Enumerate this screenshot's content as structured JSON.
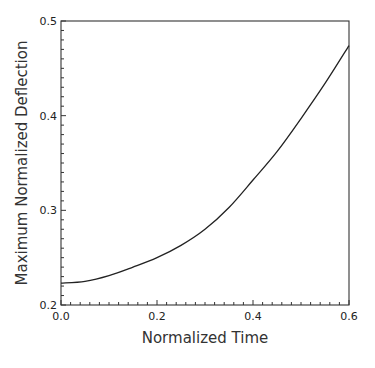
{
  "chart_data": {
    "type": "line",
    "title": "",
    "xlabel": "Normalized Time",
    "ylabel": "Maximum Normalized Deflection",
    "xlim": [
      0.0,
      0.6
    ],
    "ylim": [
      0.2,
      0.5
    ],
    "xticks": [
      "0.0",
      "0.2",
      "0.4",
      "0.6"
    ],
    "yticks": [
      "0.2",
      "0.3",
      "0.4",
      "0.5"
    ],
    "grid": false,
    "legend": null,
    "series": [
      {
        "name": "Maximum Normalized Deflection",
        "color": "#222222",
        "x": [
          0.0,
          0.05,
          0.1,
          0.15,
          0.2,
          0.25,
          0.3,
          0.35,
          0.4,
          0.45,
          0.5,
          0.55,
          0.6
        ],
        "y": [
          0.223,
          0.225,
          0.231,
          0.24,
          0.25,
          0.263,
          0.28,
          0.303,
          0.332,
          0.362,
          0.397,
          0.434,
          0.474
        ]
      }
    ]
  }
}
